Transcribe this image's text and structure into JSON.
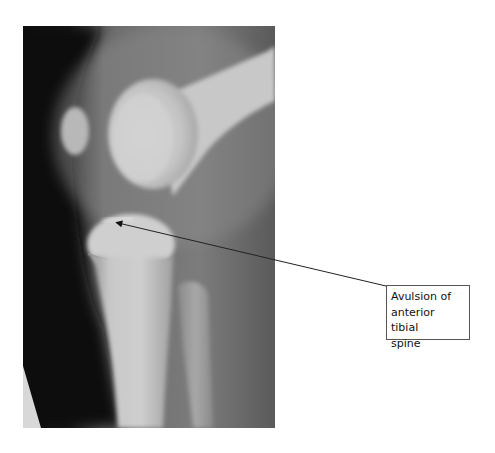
{
  "figure": {
    "type": "radiograph",
    "view": "lateral knee",
    "annotation": {
      "label_lines": [
        "Avulsion of",
        "anterior tibial",
        "spine"
      ],
      "label_full": "Avulsion of anterior tibial spine",
      "arrow": {
        "from": [
          386,
          286
        ],
        "to": [
          114,
          222
        ]
      }
    }
  }
}
